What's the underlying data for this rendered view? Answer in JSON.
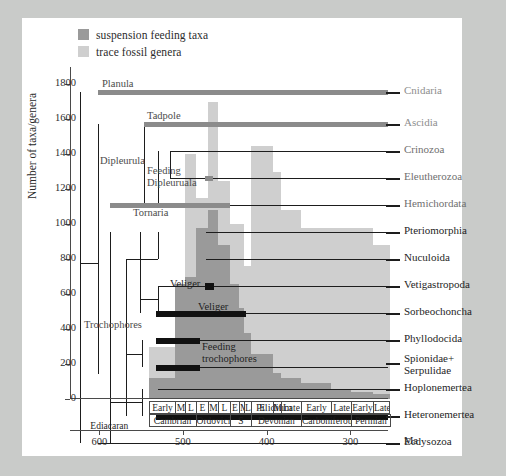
{
  "legend": {
    "items": [
      {
        "label": "suspension feeding taxa",
        "color": "#9a9a9a",
        "name": "legend-suspension-feeding"
      },
      {
        "label": "trace fossil genera",
        "color": "#cfcfcf",
        "name": "legend-trace-fossil"
      }
    ]
  },
  "yaxis": {
    "title": "Number of taxa/genera",
    "ticks": [
      0,
      200,
      400,
      600,
      800,
      1000,
      1200,
      1400,
      1600,
      1800
    ],
    "min": 0,
    "max": 1900
  },
  "xaxis": {
    "unit": "Ma",
    "ticks": [
      600,
      500,
      400,
      300
    ],
    "min": 635,
    "max": 255,
    "reversed": true
  },
  "timescale": {
    "epochs": [
      {
        "label": "Early",
        "start": 541,
        "end": 509
      },
      {
        "label": "M",
        "start": 509,
        "end": 497
      },
      {
        "label": "L",
        "start": 497,
        "end": 485
      },
      {
        "label": "E",
        "start": 485,
        "end": 470
      },
      {
        "label": "M",
        "start": 470,
        "end": 458
      },
      {
        "label": "L",
        "start": 458,
        "end": 444
      },
      {
        "label": "E",
        "start": 444,
        "end": 433
      },
      {
        "label": "M",
        "start": 433,
        "end": 427
      },
      {
        "label": "L",
        "start": 427,
        "end": 419
      },
      {
        "label": "E",
        "start": 419,
        "end": 393
      },
      {
        "label": "M",
        "start": 393,
        "end": 383
      },
      {
        "label": "Late",
        "start": 383,
        "end": 359
      },
      {
        "label": "Early",
        "start": 359,
        "end": 323
      },
      {
        "label": "Late",
        "start": 323,
        "end": 299
      },
      {
        "label": "Early",
        "start": 299,
        "end": 273
      },
      {
        "label": "Late",
        "start": 273,
        "end": 252
      }
    ],
    "periods": [
      {
        "label": "Ediacaran",
        "start": 635,
        "end": 541
      },
      {
        "label": "Cambrian",
        "start": 541,
        "end": 485
      },
      {
        "label": "Ordovician",
        "start": 485,
        "end": 444
      },
      {
        "label": "S",
        "start": 444,
        "end": 419
      },
      {
        "label": "Devonian",
        "start": 419,
        "end": 359
      },
      {
        "label": "Carboniferous",
        "start": 359,
        "end": 299
      },
      {
        "label": "Permian",
        "start": 299,
        "end": 252
      }
    ]
  },
  "taxa": [
    {
      "label": "Cnidaria",
      "shade": "faded"
    },
    {
      "label": "Ascidia",
      "shade": "faded"
    },
    {
      "label": "Crinozoa",
      "shade": "mid"
    },
    {
      "label": "Eleutherozoa",
      "shade": "mid"
    },
    {
      "label": "Hemichordata",
      "shade": "mid"
    },
    {
      "label": "Pteriomorphia",
      "shade": "solid"
    },
    {
      "label": "Nuculoida",
      "shade": "solid"
    },
    {
      "label": "Vetigastropoda",
      "shade": "solid"
    },
    {
      "label": "Sorbeochoncha",
      "shade": "solid"
    },
    {
      "label": "Phyllodocida",
      "shade": "solid"
    },
    {
      "label": "Spionidae+\nSerpulidae",
      "shade": "solid"
    },
    {
      "label": "Hoplonemertea",
      "shade": "solid"
    },
    {
      "label": "Heteronemertea",
      "shade": "solid"
    },
    {
      "label": "Ecdysozoa",
      "shade": "solid"
    }
  ],
  "larval_labels": [
    {
      "label": "Planula",
      "tone": "light"
    },
    {
      "label": "Tadpole",
      "tone": "light"
    },
    {
      "label": "Dipleurula",
      "tone": "light"
    },
    {
      "label": "Feeding\nDipleuruala",
      "tone": "light"
    },
    {
      "label": "Tornaria",
      "tone": "light"
    },
    {
      "label": "Veliger",
      "tone": "dark"
    },
    {
      "label": "Veliger",
      "tone": "dark"
    },
    {
      "label": "Trochophores",
      "tone": "light"
    },
    {
      "label": "Feeding\ntrochophores",
      "tone": "dark"
    },
    {
      "label": "Pilidium",
      "tone": "dark"
    }
  ],
  "chart_data": {
    "type": "bar",
    "title": "",
    "xlabel": "Ma",
    "ylabel": "Number of taxa/genera",
    "ylim": [
      0,
      1900
    ],
    "xlim": [
      635,
      255
    ],
    "grid": false,
    "legend_position": "top-left",
    "bin_edges_ma": [
      541,
      509,
      497,
      485,
      470,
      458,
      444,
      433,
      427,
      419,
      393,
      383,
      359,
      323,
      299,
      273,
      252
    ],
    "bin_labels": [
      "Cambrian Early",
      "Cambrian M",
      "Cambrian L",
      "Ordovician E",
      "Ordovician M",
      "Ordovician L",
      "Silurian E",
      "Silurian M",
      "Silurian L",
      "Devonian E",
      "Devonian M",
      "Devonian Late",
      "Carboniferous Early",
      "Carboniferous Late",
      "Permian Early",
      "Permian Late"
    ],
    "series": [
      {
        "name": "trace fossil genera",
        "color": "#cfcfcf",
        "values": [
          300,
          440,
          1400,
          1150,
          1700,
          1250,
          1000,
          1000,
          760,
          1450,
          1300,
          1080,
          980,
          980,
          980,
          880
        ]
      },
      {
        "name": "suspension feeding taxa",
        "color": "#9a9a9a",
        "values": [
          120,
          660,
          700,
          980,
          1080,
          880,
          660,
          520,
          380,
          260,
          150,
          120,
          90,
          60,
          40,
          30
        ]
      }
    ]
  }
}
